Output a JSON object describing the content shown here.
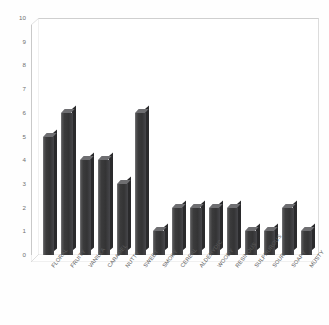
{
  "chart_data": {
    "type": "bar",
    "title": "",
    "subtitle": "",
    "xlabel": "",
    "ylabel": "",
    "ylim": [
      0,
      10
    ],
    "ytick_step": 1,
    "yticks": [
      10,
      9,
      8,
      7,
      6,
      5,
      4,
      3,
      2,
      1,
      0
    ],
    "grid": false,
    "legend": false,
    "legend_position": "none",
    "style": "3d-column",
    "categories": [
      "FLORAL",
      "FRUITY",
      "VANILLA",
      "CARAMEL",
      "NUTTY",
      "SWEET",
      "SMOKY",
      "CEREAL",
      "ALDEHYDIC",
      "WOODY",
      "RESINOUS",
      "SULPHUROUS",
      "SOUR",
      "SOAPY",
      "MUSTY"
    ],
    "values": [
      5,
      6,
      4,
      4,
      3,
      6,
      1,
      2,
      2,
      2,
      2,
      1,
      1,
      2,
      1
    ]
  },
  "colors": {
    "bar_front": "#3b3b3c",
    "bar_top": "#6e6e71",
    "bar_side": "#2a2a2c",
    "plot_background": "#ffffff",
    "page_background": "#fefefe",
    "axis_line": "#c9c9c9",
    "tick_text": "#5c5c5c"
  }
}
